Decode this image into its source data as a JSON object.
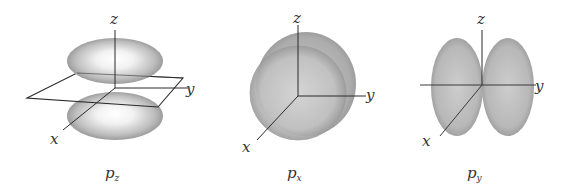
{
  "figure": {
    "panels": [
      {
        "id": "pz",
        "label_main": "p",
        "label_sub": "z",
        "axes": {
          "z": "z",
          "y": "y",
          "x": "x"
        },
        "shape": "two lobes stacked along z axis with xy-plane between them"
      },
      {
        "id": "px",
        "label_main": "p",
        "label_sub": "x",
        "axes": {
          "z": "z",
          "y": "y",
          "x": "x"
        },
        "shape": "two lobes along x axis (front and back), overlapping as viewed"
      },
      {
        "id": "py",
        "label_main": "p",
        "label_sub": "y",
        "axes": {
          "z": "z",
          "y": "y",
          "x": "x"
        },
        "shape": "two lobes side by side along y axis"
      }
    ],
    "colors": {
      "lobe_light": "#f4f4f4",
      "lobe_mid": "#c8c8c8",
      "lobe_dark": "#8e8e8e",
      "axis": "#2a2a2a",
      "text": "#333333"
    }
  }
}
